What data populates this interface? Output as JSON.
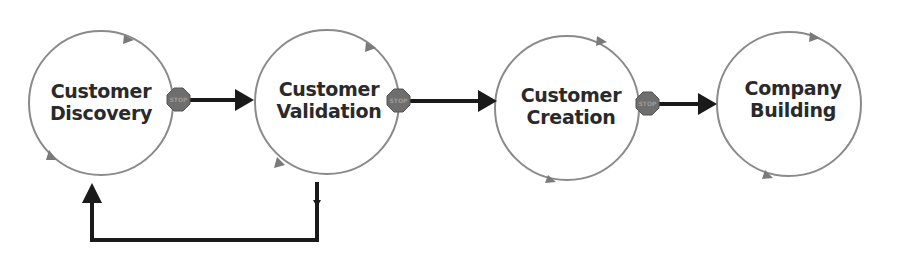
{
  "diagram": {
    "type": "process-flow",
    "stages": [
      {
        "id": "customer-discovery",
        "line1": "Customer",
        "line2": "Discovery"
      },
      {
        "id": "customer-validation",
        "line1": "Customer",
        "line2": "Validation"
      },
      {
        "id": "customer-creation",
        "line1": "Customer",
        "line2": "Creation"
      },
      {
        "id": "company-building",
        "line1": "Company",
        "line2": "Building"
      }
    ],
    "stop_label": "STOP",
    "edges": [
      {
        "from": "customer-discovery",
        "to": "customer-validation",
        "kind": "forward"
      },
      {
        "from": "customer-validation",
        "to": "customer-creation",
        "kind": "forward"
      },
      {
        "from": "customer-creation",
        "to": "company-building",
        "kind": "forward"
      },
      {
        "from": "customer-validation",
        "to": "customer-discovery",
        "kind": "loop-back"
      }
    ],
    "colors": {
      "circle_stroke": "#8a8a8a",
      "arrow": "#1a1a1a",
      "stop_sign": "#6e6e6e",
      "text": "#2a2a2a"
    }
  }
}
